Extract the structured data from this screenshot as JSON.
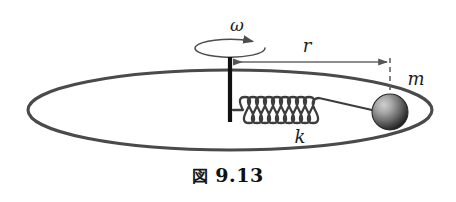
{
  "figure": {
    "caption_kanji": "図",
    "caption_number": "9.13",
    "labels": {
      "angular_velocity": "ω",
      "radius": "r",
      "mass": "m",
      "spring_constant": "k"
    },
    "colors": {
      "ink": "#3a3a3a",
      "axle": "#111111",
      "orbit_stroke": "#4a4a4a",
      "spring_stroke": "#3d3d3d",
      "arrow": "#555555",
      "ball_light": "#bdbdbd",
      "ball_dark": "#1f1f1f",
      "background": "#ffffff"
    },
    "elements": {
      "orbit_ellipse": "circular-path-ellipse",
      "rotation_ellipse": "rotation-indicator-ellipse",
      "axle": "vertical-rotation-axle",
      "spring": "helical-spring",
      "mass_ball": "point-mass-sphere",
      "radius_arrow": "radius-dimension-arrow",
      "reference_line": "mass-center-dashed-line"
    },
    "geometry": {
      "orbit_center_x": 230,
      "orbit_center_y": 110,
      "orbit_rx": 202,
      "orbit_ry": 40,
      "axle_x": 230,
      "axle_top_y": 57,
      "axle_bottom_y": 122,
      "rotation_ellipse_cx": 230,
      "rotation_ellipse_cy": 48,
      "rotation_ellipse_rx": 35,
      "rotation_ellipse_ry": 9,
      "radius_arrow_y": 62,
      "radius_arrow_x1": 234,
      "radius_arrow_x2": 387,
      "dashed_line_x": 390,
      "dashed_line_y1": 60,
      "dashed_line_y2": 97,
      "spring_y": 110,
      "spring_start_x": 233,
      "spring_end_x": 368,
      "spring_coils": 9,
      "ball_cx": 390,
      "ball_cy": 112,
      "ball_r": 18
    }
  }
}
